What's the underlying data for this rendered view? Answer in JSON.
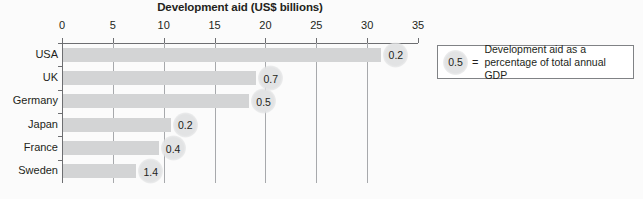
{
  "chart_data": {
    "type": "bar",
    "orientation": "horizontal",
    "title": "Development aid (US$ billions)",
    "xlabel": "",
    "ylabel": "",
    "xlim": [
      0,
      35
    ],
    "xticks": [
      0,
      5,
      10,
      15,
      20,
      25,
      30,
      35
    ],
    "grid": true,
    "legend_position": "right",
    "categories": [
      "USA",
      "UK",
      "Germany",
      "Japan",
      "France",
      "Sweden"
    ],
    "values": [
      31.3,
      19.0,
      18.3,
      10.6,
      9.4,
      7.2
    ],
    "point_labels": [
      "0.2",
      "0.7",
      "0.5",
      "0.2",
      "0.4",
      "1.4"
    ],
    "point_label_meaning": "Development aid as a percentage of total annual GDP",
    "series": [
      {
        "name": "Development aid (US$ billions)",
        "values": [
          31.3,
          19.0,
          18.3,
          10.6,
          9.4,
          7.2
        ]
      },
      {
        "name": "Development aid as a percentage of total annual GDP",
        "values": [
          0.2,
          0.7,
          0.5,
          0.2,
          0.4,
          1.4
        ]
      }
    ]
  },
  "legend": {
    "sample_value": "0.5",
    "equals": "=",
    "description": "Development aid as a percentage of total annual GDP"
  },
  "colors": {
    "bar_fill": "#d3d4d5",
    "bubble_fill": "#e2e3e4",
    "axis": "#6d6e71",
    "gridline": "#a7a9ac",
    "text": "#231f20",
    "background": "#fbfbfb",
    "legend_border": "#808285"
  }
}
